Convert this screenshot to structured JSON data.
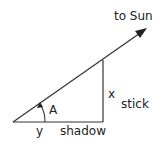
{
  "diagram": {
    "type": "right-triangle-sun-shadow",
    "labels": {
      "direction": "to Sun",
      "angle": "A",
      "height_var": "x",
      "height_name": "stick",
      "base_var": "y",
      "base_name": "shadow"
    },
    "colors": {
      "line": "#222222",
      "background": "#ffffff"
    }
  }
}
